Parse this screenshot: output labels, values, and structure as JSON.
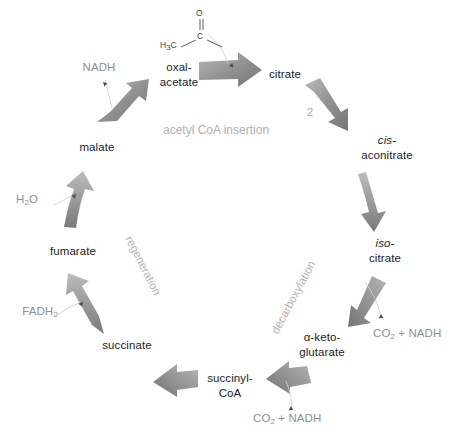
{
  "diagram": {
    "center_note": "acetyl CoA insertion",
    "background_color": "#ffffff",
    "arrow_color": "#8c8c8c",
    "label_color": "#1d1d1d",
    "muted_color": "#a6a6a6"
  },
  "metabolites": [
    {
      "id": "oxaloacetate",
      "line1": "oxal-",
      "line2": "acetate"
    },
    {
      "id": "citrate",
      "line1": "citrate",
      "line2": ""
    },
    {
      "id": "cis-aconitrate",
      "line1": "cis-",
      "line2": "aconitrate",
      "italic_line": 1
    },
    {
      "id": "iso-citrate",
      "line1": "iso-",
      "line2": "citrate",
      "italic_line": 1
    },
    {
      "id": "alpha-ketoglutarate",
      "line1": "α-keto-",
      "line2": "glutarate"
    },
    {
      "id": "succinyl-coa",
      "line1": "succinyl-",
      "line2": "CoA"
    },
    {
      "id": "succinate",
      "line1": "succinate",
      "line2": ""
    },
    {
      "id": "fumarate",
      "line1": "fumarate",
      "line2": ""
    },
    {
      "id": "malate",
      "line1": "malate",
      "line2": ""
    }
  ],
  "side_products": [
    {
      "id": "nadh-malate",
      "text": "NADH"
    },
    {
      "id": "water-fumarate",
      "text_pre": "H",
      "text_sub": "2",
      "text_post": "O"
    },
    {
      "id": "fadh2-succinate",
      "text_pre": "FADH",
      "text_sub": "2",
      "text_post": ""
    },
    {
      "id": "co2-nadh-isocitrate",
      "text_pre": "CO",
      "text_sub": "2",
      "text_post": " + NADH"
    },
    {
      "id": "co2-nadh-ketoglutarate",
      "text_pre": "CO",
      "text_sub": "2",
      "text_post": " + NADH"
    }
  ],
  "process_labels": [
    {
      "id": "acetyl-coa-insertion",
      "text": "acetyl CoA insertion"
    },
    {
      "id": "regeneration",
      "text": "regeneration"
    },
    {
      "id": "decarboxylation",
      "text": "decarboxylation"
    }
  ],
  "arrow_annotations": [
    {
      "id": "citrate-step-count",
      "text": "2"
    }
  ],
  "acetyl_structure": {
    "oxygen": "O",
    "carbon": "C",
    "methyl_pre": "H",
    "methyl_sub": "3",
    "methyl_post": "C"
  }
}
